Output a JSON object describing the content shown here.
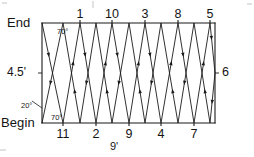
{
  "figure": {
    "type": "zigzag-traverse-diagram",
    "line_color": "#1a1a1a",
    "frame": {
      "left_x": 42,
      "right_x": 215,
      "top_y": 23,
      "bottom_y": 123
    },
    "endpoints": {
      "end_label": "End",
      "begin_label": "Begin"
    },
    "dimensions": {
      "height_label": "4.5'",
      "width_label": "9'",
      "right_label": "6"
    },
    "angles": [
      {
        "id": "angle-top",
        "label": "70°",
        "x": 57,
        "y": 28
      },
      {
        "id": "angle-bottom-interior",
        "label": "70°",
        "x": 51,
        "y": 114
      },
      {
        "id": "angle-left-vertical",
        "label": "20°",
        "x": 21,
        "y": 102
      }
    ],
    "top_vertices": [
      {
        "label": "1",
        "x": 80
      },
      {
        "label": "10",
        "x": 112
      },
      {
        "label": "3",
        "x": 145
      },
      {
        "label": "8",
        "x": 178
      },
      {
        "label": "5",
        "x": 210
      }
    ],
    "bottom_vertices": [
      {
        "label": "11",
        "x": 63
      },
      {
        "label": "2",
        "x": 96
      },
      {
        "label": "9",
        "x": 129
      },
      {
        "label": "4",
        "x": 161
      },
      {
        "label": "7",
        "x": 194
      }
    ],
    "path_points": [
      {
        "x": 42,
        "y": 23
      },
      {
        "x": 63,
        "y": 123
      },
      {
        "x": 80,
        "y": 23
      },
      {
        "x": 96,
        "y": 123
      },
      {
        "x": 112,
        "y": 23
      },
      {
        "x": 129,
        "y": 123
      },
      {
        "x": 145,
        "y": 23
      },
      {
        "x": 161,
        "y": 123
      },
      {
        "x": 178,
        "y": 23
      },
      {
        "x": 194,
        "y": 123
      },
      {
        "x": 210,
        "y": 23
      },
      {
        "x": 215,
        "y": 73
      },
      {
        "x": 210,
        "y": 123
      },
      {
        "x": 194,
        "y": 23
      },
      {
        "x": 178,
        "y": 123
      },
      {
        "x": 161,
        "y": 23
      },
      {
        "x": 145,
        "y": 123
      },
      {
        "x": 129,
        "y": 23
      },
      {
        "x": 112,
        "y": 123
      },
      {
        "x": 96,
        "y": 23
      },
      {
        "x": 80,
        "y": 123
      },
      {
        "x": 63,
        "y": 23
      },
      {
        "x": 42,
        "y": 123
      }
    ]
  }
}
